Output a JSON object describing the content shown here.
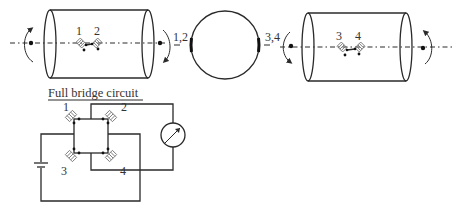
{
  "diagram": {
    "left_shaft": {
      "gauge_labels": [
        "1",
        "2"
      ]
    },
    "cross_section": {
      "left_label": "1,2",
      "right_label": "3,4"
    },
    "right_shaft": {
      "gauge_labels": [
        "3",
        "4"
      ]
    },
    "bridge": {
      "title": "Full bridge circuit",
      "arm_labels": [
        "1",
        "2",
        "3",
        "4"
      ],
      "components": [
        "battery-icon",
        "galvanometer-icon"
      ]
    }
  }
}
